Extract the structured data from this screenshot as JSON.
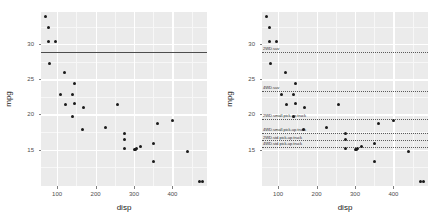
{
  "chart_data": {
    "type": "scatter",
    "title": "",
    "xlabel": "disp",
    "ylabel": "mpg",
    "xlim": [
      58,
      490
    ],
    "ylim": [
      9.8,
      34.6
    ],
    "xticks": [
      100,
      200,
      300,
      400
    ],
    "yticks": [
      15,
      20,
      25,
      30
    ],
    "grid": true,
    "legend": "none",
    "panels": [
      {
        "name": "left-panel",
        "reference_lines": [
          {
            "kind": "solid",
            "y": 28.9,
            "label": ""
          }
        ]
      },
      {
        "name": "right-panel",
        "reference_lines": [
          {
            "kind": "dotted",
            "y": 28.9,
            "label": "2WD.suv"
          },
          {
            "kind": "dotted",
            "y": 23.4,
            "label": "4WD.suv"
          },
          {
            "kind": "dotted",
            "y": 19.4,
            "label": "2WD.small.pick-up.truck"
          },
          {
            "kind": "dotted",
            "y": 17.4,
            "label": "4WD.small.pick-up.truck"
          },
          {
            "kind": "dotted",
            "y": 16.3,
            "label": "2WD.std.pick-up.truck"
          },
          {
            "kind": "dotted",
            "y": 15.4,
            "label": "4WD.std.pick-up.truck"
          }
        ]
      }
    ],
    "x": [
      71,
      78,
      78,
      95,
      79,
      120,
      108,
      146,
      141,
      121,
      146,
      168,
      140,
      167,
      225,
      258,
      275,
      275,
      274,
      302,
      305,
      307,
      318,
      351,
      360,
      350,
      400,
      440,
      470,
      478
    ],
    "y": [
      33.9,
      32.4,
      30.4,
      30.4,
      27.3,
      26.0,
      22.8,
      24.4,
      22.8,
      21.4,
      21.5,
      21.0,
      19.7,
      17.8,
      18.1,
      21.4,
      17.3,
      16.4,
      15.2,
      15.0,
      15.0,
      15.2,
      15.5,
      15.8,
      18.7,
      13.3,
      19.2,
      14.7,
      10.4,
      10.4
    ],
    "point_color": "#1a1a1a",
    "panel_bg": "#ebebeb",
    "grid_color": "#ffffff",
    "solid_line_color": "#4d4d4d",
    "dotted_line_color": "#5a5a5a"
  }
}
